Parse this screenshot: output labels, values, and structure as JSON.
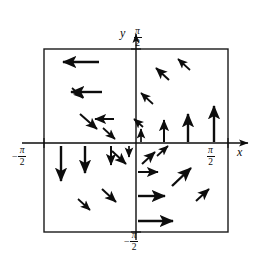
{
  "figure": {
    "axis_labels": {
      "x": "x",
      "y": "y"
    },
    "tick_labels": {
      "y_top": {
        "sign": "",
        "numerator": "π",
        "denominator": "2"
      },
      "y_bottom": {
        "sign": "−",
        "numerator": "π",
        "denominator": "2"
      },
      "x_right": {
        "sign": "",
        "numerator": "π",
        "denominator": "2"
      },
      "x_left": {
        "sign": "−",
        "numerator": "π",
        "denominator": "2"
      }
    },
    "colors": {
      "ink": "#0d0d0d",
      "background": "#ffffff",
      "frame": "#1a1a1a"
    }
  },
  "chart_data": {
    "type": "scatter",
    "xlabel": "x",
    "ylabel": "y",
    "xlim": [
      -1.5707963,
      1.5707963
    ],
    "ylim": [
      -1.5707963,
      1.5707963
    ],
    "grid": false,
    "legend": null,
    "frame": {
      "x0": 44,
      "y0": 49,
      "x1": 228,
      "y1": 232
    },
    "origin": {
      "x": 136,
      "y": 143
    },
    "annotations": [
      "y axis arrow at top",
      "x axis arrow at right",
      "counterclockwise circulation about the origin"
    ],
    "vectors": [
      {
        "x": 99,
        "y": 62,
        "dx": -36,
        "dy": 0,
        "len": 36
      },
      {
        "x": 102,
        "y": 92,
        "dx": -31,
        "dy": 0,
        "len": 31
      },
      {
        "x": 114,
        "y": 119,
        "dx": -19,
        "dy": 0,
        "len": 19
      },
      {
        "x": 72,
        "y": 88,
        "dx": 11,
        "dy": 10,
        "len": 15
      },
      {
        "x": 80,
        "y": 114,
        "dx": 17,
        "dy": 15,
        "len": 23
      },
      {
        "x": 103,
        "y": 128,
        "dx": 12,
        "dy": 11,
        "len": 16
      },
      {
        "x": 112,
        "y": 151,
        "dx": 14,
        "dy": 13,
        "len": 19
      },
      {
        "x": 61,
        "y": 146,
        "dx": 0,
        "dy": 35,
        "len": 35
      },
      {
        "x": 85,
        "y": 146,
        "dx": 0,
        "dy": 27,
        "len": 27
      },
      {
        "x": 111,
        "y": 146,
        "dx": 0,
        "dy": 19,
        "len": 19
      },
      {
        "x": 129,
        "y": 146,
        "dx": 0,
        "dy": 11,
        "len": 11
      },
      {
        "x": 102,
        "y": 189,
        "dx": 14,
        "dy": 13,
        "len": 19
      },
      {
        "x": 78,
        "y": 199,
        "dx": 12,
        "dy": 11,
        "len": 16
      },
      {
        "x": 169,
        "y": 80,
        "dx": -13,
        "dy": -12,
        "len": 18
      },
      {
        "x": 190,
        "y": 70,
        "dx": -12,
        "dy": -11,
        "len": 16
      },
      {
        "x": 153,
        "y": 104,
        "dx": -12,
        "dy": -11,
        "len": 16
      },
      {
        "x": 143,
        "y": 127,
        "dx": -9,
        "dy": -8,
        "len": 12
      },
      {
        "x": 141,
        "y": 142,
        "dx": 0,
        "dy": -13,
        "len": 13
      },
      {
        "x": 164,
        "y": 142,
        "dx": 0,
        "dy": -22,
        "len": 22
      },
      {
        "x": 188,
        "y": 142,
        "dx": 0,
        "dy": -28,
        "len": 28
      },
      {
        "x": 214,
        "y": 142,
        "dx": 0,
        "dy": -36,
        "len": 36
      },
      {
        "x": 142,
        "y": 164,
        "dx": 13,
        "dy": -12,
        "len": 18
      },
      {
        "x": 157,
        "y": 156,
        "dx": 11,
        "dy": -10,
        "len": 15
      },
      {
        "x": 138,
        "y": 172,
        "dx": 20,
        "dy": 0,
        "len": 20
      },
      {
        "x": 138,
        "y": 196,
        "dx": 27,
        "dy": 0,
        "len": 27
      },
      {
        "x": 138,
        "y": 221,
        "dx": 35,
        "dy": 0,
        "len": 35
      },
      {
        "x": 172,
        "y": 186,
        "dx": 19,
        "dy": -18,
        "len": 26
      },
      {
        "x": 196,
        "y": 201,
        "dx": 13,
        "dy": -12,
        "len": 18
      }
    ]
  }
}
